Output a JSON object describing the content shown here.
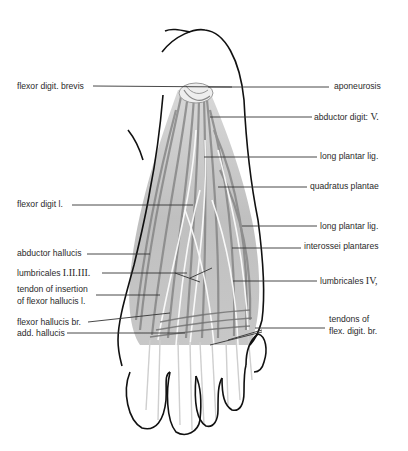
{
  "figure": {
    "colors": {
      "outline": "#111111",
      "muscle": "#8a8a8a",
      "muscle_light": "#bdbdbd",
      "leader": "#333333",
      "background": "#ffffff"
    }
  },
  "labels_left": [
    {
      "id": "flexor-digit-brevis",
      "text": "flexor digit. brevis",
      "x": 17,
      "y": 81,
      "line_to": [
        232,
        87
      ]
    },
    {
      "id": "flexor-digit-l",
      "text": "flexor digit l.",
      "x": 17,
      "y": 199,
      "line_to": [
        193,
        205
      ]
    },
    {
      "id": "abductor-hallucis",
      "text": "abductor hallucis",
      "x": 17,
      "y": 248,
      "line_to": [
        150,
        254
      ]
    },
    {
      "id": "lumbricales-i-ii-iii",
      "text": "lumbricales",
      "roman": "I.II.III.",
      "x": 17,
      "y": 267,
      "line_to": [
        187,
        273
      ]
    },
    {
      "id": "tendon-insertion-flexor-hallucis",
      "text": "tendon of insertion",
      "text2": "of flexor hallucis l.",
      "x": 17,
      "y": 286,
      "line_to": [
        160,
        295
      ]
    },
    {
      "id": "flexor-hallucis-br",
      "text": "flexor hallucis br.",
      "x": 17,
      "y": 319,
      "line_to": [
        170,
        313
      ]
    },
    {
      "id": "add-hallucis",
      "text": "add. hallucis",
      "x": 17,
      "y": 333,
      "line_to": [
        185,
        333
      ]
    }
  ],
  "labels_right": [
    {
      "id": "aponeurosis",
      "text": "aponeurosis",
      "x": 334,
      "y": 81,
      "line_to": [
        208,
        87
      ]
    },
    {
      "id": "abductor-digit-v",
      "text": "abductor digit:",
      "roman": "V.",
      "x": 314,
      "y": 111,
      "line_to": [
        210,
        117
      ]
    },
    {
      "id": "long-plantar-lig-1",
      "text": "long plantar lig.",
      "x": 320,
      "y": 151,
      "line_to": [
        204,
        157
      ]
    },
    {
      "id": "quadratus-plantae",
      "text": "quadratus plantae",
      "x": 310,
      "y": 181,
      "line_to": [
        218,
        187
      ]
    },
    {
      "id": "long-plantar-lig-2",
      "text": "long plantar lig.",
      "x": 320,
      "y": 221,
      "line_to": [
        242,
        226
      ]
    },
    {
      "id": "interossei-plantares",
      "text": "interossei plantares",
      "x": 304,
      "y": 241,
      "line_to": [
        232,
        248
      ]
    },
    {
      "id": "lumbricales-iv",
      "text": "lumbricales",
      "roman": "IV,",
      "x": 320,
      "y": 275,
      "line_to": [
        233,
        281
      ]
    },
    {
      "id": "tendons-flex-digit-br",
      "text": "tendons of",
      "text2": "flex. digit. br.",
      "x": 329,
      "y": 318,
      "line_to": [
        255,
        328
      ]
    }
  ]
}
